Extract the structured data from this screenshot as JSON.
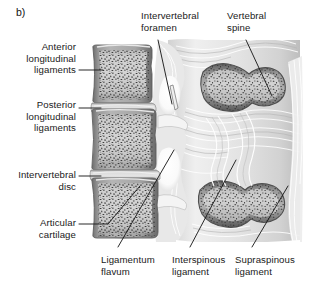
{
  "figure": {
    "panel_letter": "b)",
    "palette": {
      "background": "#ffffff",
      "text": "#1a1a1a",
      "leader_line": "#1d1d1d",
      "bone_fill": "#c8c8c8",
      "bone_rim_dark": "#6e6e6e",
      "bone_rim_mid": "#8f8f8f",
      "trabecula_speckle": "#3a3a3a",
      "disc_light": "#d9d9d9",
      "ligament_fibre": "#f2f2f2",
      "foramen_white": "#fdfdfd",
      "shadow": "#7a7a7a"
    }
  },
  "labels": {
    "anterior_longitudinal_ligaments": "Anterior\nlongitudinal\nligaments",
    "posterior_longitudinal_ligaments": "Posterior\nlongitudinal\nligaments",
    "intervertebral_disc": "Intervertebral\ndisc",
    "articular_cartilage": "Articular\ncartilage",
    "intervertebral_foramen": "Intervertebral\nforamen",
    "vertebral_spine": "Vertebral\nspine",
    "ligamentum_flavum": "Ligamentum\nflavum",
    "interspinous_ligament": "Interspinous\nligament",
    "supraspinous_ligament": "Supraspinous\nligament"
  },
  "anatomy": {
    "vertebral_bodies": 3,
    "intervertebral_discs": 2,
    "spinous_processes": 2,
    "intervertebral_foramina": 2
  }
}
